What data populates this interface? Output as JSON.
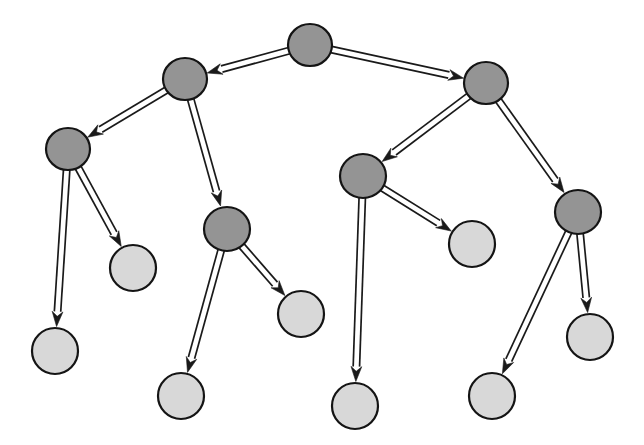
{
  "figure": {
    "title": "",
    "background_color": "#ffffff",
    "width": 644,
    "height": 445
  },
  "chart_data": {
    "type": "diagram",
    "diagram_type": "directed-tree-graph",
    "title": "",
    "xlabel": "",
    "ylabel": "",
    "grid": false,
    "legend": null,
    "node_count": 14,
    "edge_count": 13,
    "colors": {
      "internal_node_fill": "#949494",
      "leaf_node_fill": "#d8d8d8",
      "node_stroke": "#141414",
      "edge_stroke": "#1a1a1a",
      "background": "#ffffff"
    },
    "node_styles": {
      "internal": "dark-gray-filled-ellipse",
      "leaf": "light-gray-filled-ellipse"
    },
    "edge_style": "double-line-with-solid-arrowhead",
    "nodes": [
      {
        "id": "n0",
        "label": "",
        "kind": "internal",
        "cx": 310,
        "cy": 45,
        "rx": 22,
        "ry": 21,
        "depth": 0
      },
      {
        "id": "n1",
        "label": "",
        "kind": "internal",
        "cx": 185,
        "cy": 79,
        "rx": 22,
        "ry": 21,
        "depth": 1
      },
      {
        "id": "n2",
        "label": "",
        "kind": "internal",
        "cx": 486,
        "cy": 83,
        "rx": 22,
        "ry": 21,
        "depth": 1
      },
      {
        "id": "n3",
        "label": "",
        "kind": "internal",
        "cx": 68,
        "cy": 149,
        "rx": 22,
        "ry": 21,
        "depth": 2
      },
      {
        "id": "n4",
        "label": "",
        "kind": "internal",
        "cx": 227,
        "cy": 229,
        "rx": 23,
        "ry": 22,
        "depth": 2
      },
      {
        "id": "n5",
        "label": "",
        "kind": "internal",
        "cx": 363,
        "cy": 176,
        "rx": 23,
        "ry": 22,
        "depth": 2
      },
      {
        "id": "n6",
        "label": "",
        "kind": "internal",
        "cx": 578,
        "cy": 212,
        "rx": 23,
        "ry": 22,
        "depth": 2
      },
      {
        "id": "n7",
        "label": "",
        "kind": "leaf",
        "cx": 55,
        "cy": 351,
        "rx": 23,
        "ry": 23,
        "depth": 3
      },
      {
        "id": "n8",
        "label": "",
        "kind": "leaf",
        "cx": 133,
        "cy": 268,
        "rx": 23,
        "ry": 23,
        "depth": 3
      },
      {
        "id": "n9",
        "label": "",
        "kind": "leaf",
        "cx": 181,
        "cy": 396,
        "rx": 23,
        "ry": 23,
        "depth": 3
      },
      {
        "id": "n10",
        "label": "",
        "kind": "leaf",
        "cx": 301,
        "cy": 314,
        "rx": 23,
        "ry": 23,
        "depth": 3
      },
      {
        "id": "n11",
        "label": "",
        "kind": "leaf",
        "cx": 355,
        "cy": 406,
        "rx": 23,
        "ry": 23,
        "depth": 3
      },
      {
        "id": "n12",
        "label": "",
        "kind": "leaf",
        "cx": 472,
        "cy": 244,
        "rx": 23,
        "ry": 23,
        "depth": 3
      },
      {
        "id": "n13",
        "label": "",
        "kind": "leaf",
        "cx": 492,
        "cy": 396,
        "rx": 23,
        "ry": 23,
        "depth": 3
      },
      {
        "id": "n14",
        "label": "",
        "kind": "leaf",
        "cx": 590,
        "cy": 337,
        "rx": 23,
        "ry": 23,
        "depth": 3
      }
    ],
    "edges": [
      {
        "from": "n0",
        "to": "n1",
        "directed": true
      },
      {
        "from": "n0",
        "to": "n2",
        "directed": true
      },
      {
        "from": "n1",
        "to": "n3",
        "directed": true
      },
      {
        "from": "n1",
        "to": "n4",
        "directed": true
      },
      {
        "from": "n2",
        "to": "n5",
        "directed": true
      },
      {
        "from": "n2",
        "to": "n6",
        "directed": true
      },
      {
        "from": "n3",
        "to": "n7",
        "directed": true
      },
      {
        "from": "n3",
        "to": "n8",
        "directed": true
      },
      {
        "from": "n4",
        "to": "n9",
        "directed": true
      },
      {
        "from": "n4",
        "to": "n10",
        "directed": true
      },
      {
        "from": "n5",
        "to": "n11",
        "directed": true
      },
      {
        "from": "n5",
        "to": "n12",
        "directed": true
      },
      {
        "from": "n6",
        "to": "n13",
        "directed": true
      },
      {
        "from": "n6",
        "to": "n14",
        "directed": true
      }
    ]
  }
}
